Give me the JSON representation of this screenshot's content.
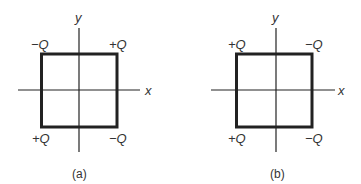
{
  "figures": [
    {
      "caption": "(a)",
      "axis_labels": {
        "x": "x",
        "y": "y"
      },
      "corners": {
        "top_left": "−Q",
        "top_right": "+Q",
        "bottom_left": "+Q",
        "bottom_right": "−Q"
      }
    },
    {
      "caption": "(b)",
      "axis_labels": {
        "x": "x",
        "y": "y"
      },
      "corners": {
        "top_left": "+Q",
        "top_right": "−Q",
        "bottom_left": "+Q",
        "bottom_right": "−Q"
      }
    }
  ]
}
